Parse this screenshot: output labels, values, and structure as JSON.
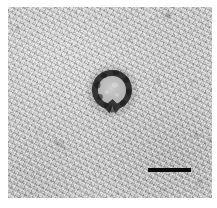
{
  "figure": {
    "kind": "electron-micrograph",
    "technique": "negative-stain transmission electron microscopy",
    "caption": "",
    "width_px": 217,
    "height_px": 208
  },
  "canvas": {
    "page_background": "#ffffff",
    "field_background": "#c9c9c9",
    "field": {
      "x": 8,
      "y": 7,
      "width": 204,
      "height": 191
    }
  },
  "particle": {
    "label": "",
    "description": "single ring-shaped stained particle with electron-lucent interior and short tail",
    "center_x": 112,
    "center_y": 92,
    "diameter_px": 36,
    "ring_color": "#2b2b2b",
    "core_color": "#b9b9b9",
    "halo_color": "#8f8f8f"
  },
  "debris": [
    {
      "name": "speck-upper-right",
      "x": 168,
      "y": 16,
      "w": 9,
      "h": 8,
      "opacity": 0.3,
      "rot": -20
    },
    {
      "name": "speck-right-mid",
      "x": 158,
      "y": 81,
      "w": 8,
      "h": 5,
      "opacity": 0.22,
      "rot": 35
    },
    {
      "name": "speck-right-edge",
      "x": 196,
      "y": 98,
      "w": 7,
      "h": 5,
      "opacity": 0.18,
      "rot": -10
    },
    {
      "name": "streak-lower-left",
      "x": 60,
      "y": 145,
      "w": 22,
      "h": 6,
      "opacity": 0.22,
      "rot": 38
    },
    {
      "name": "speck-lower-right",
      "x": 197,
      "y": 135,
      "w": 10,
      "h": 5,
      "opacity": 0.18,
      "rot": 25
    },
    {
      "name": "speck-lower-right-2",
      "x": 199,
      "y": 182,
      "w": 9,
      "h": 6,
      "opacity": 0.22,
      "rot": -32
    },
    {
      "name": "speck-center-left",
      "x": 66,
      "y": 60,
      "w": 7,
      "h": 4,
      "opacity": 0.14,
      "rot": 15
    },
    {
      "name": "speck-bottom-mid",
      "x": 120,
      "y": 175,
      "w": 8,
      "h": 4,
      "opacity": 0.14,
      "rot": -18
    }
  ],
  "scale_bar": {
    "label": "",
    "x": 148,
    "y": 168,
    "width": 43,
    "height": 4,
    "color": "#0b0b0b"
  }
}
